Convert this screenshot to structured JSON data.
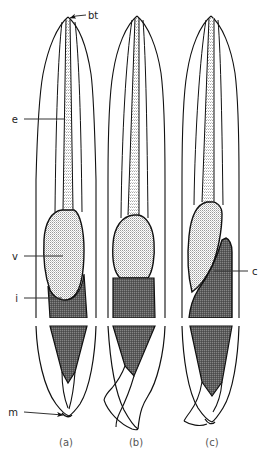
{
  "figure": {
    "background_color": "#ffffff",
    "outline_color": "#111111",
    "light_fill_color": "#d8d8d8",
    "dark_fill_color": "#6e6e6e",
    "label_color": "#222222",
    "caption_color": "#555555"
  },
  "labels": {
    "bt": "bt",
    "e": "e",
    "v": "v",
    "i": "i",
    "c": "c",
    "m": "m"
  },
  "captions": {
    "a": "(a)",
    "b": "(b)",
    "c": "(c)"
  },
  "panels": [
    {
      "id": "a",
      "caption": "(a)",
      "labels_shown": [
        "bt",
        "e",
        "v",
        "i",
        "m"
      ]
    },
    {
      "id": "b",
      "caption": "(b)",
      "labels_shown": []
    },
    {
      "id": "c",
      "caption": "(c)",
      "labels_shown": [
        "c"
      ]
    }
  ]
}
